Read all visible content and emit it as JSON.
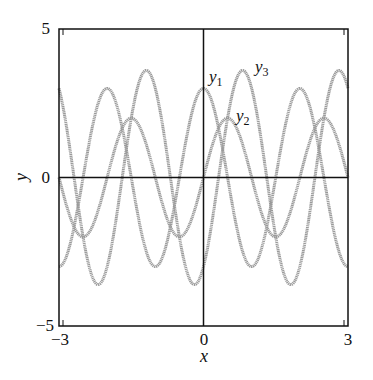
{
  "chart_data": {
    "type": "line",
    "title": "",
    "xlabel": "x",
    "ylabel": "y",
    "xlim": [
      -3,
      3
    ],
    "ylim": [
      -5,
      5
    ],
    "grid": false,
    "legend": "none (curves labeled inline)",
    "x_ticks": [
      -3,
      0,
      3
    ],
    "x_tick_labels": [
      "−3",
      "0",
      "3"
    ],
    "y_ticks": [
      -5,
      0,
      5
    ],
    "y_tick_labels": [
      "−5",
      "0",
      "5"
    ],
    "zero_axes": true,
    "line_color": "#9a9a9a",
    "axis_color": "#111111",
    "x": [
      -3,
      -2.5,
      -2,
      -1.5,
      -1,
      -0.5,
      0,
      0.5,
      1,
      1.5,
      2,
      2.5,
      3
    ],
    "series": [
      {
        "name": "y1",
        "label_main": "y",
        "label_sub": "1",
        "formula": "3cos(πx)",
        "amplitude": 3,
        "period": 2,
        "values": [
          -3,
          0,
          3,
          0,
          -3,
          0,
          3,
          0,
          -3,
          0,
          3,
          0,
          -3
        ],
        "label_pos": [
          210,
          83
        ]
      },
      {
        "name": "y2",
        "label_main": "y",
        "label_sub": "2",
        "formula": "2sin(πx)",
        "amplitude": 2,
        "period": 2,
        "values": [
          0,
          -2,
          0,
          2,
          0,
          -2,
          0,
          2,
          0,
          -2,
          0,
          2,
          0
        ],
        "label_pos": [
          237,
          122
        ]
      },
      {
        "name": "y3",
        "label_main": "y",
        "label_sub": "3",
        "formula": "2sin(πx) − 3cos(πx)",
        "amplitude": 3.6,
        "period": 2,
        "values": [
          3,
          -2,
          -3,
          2,
          3,
          -2,
          -3,
          2,
          3,
          -2,
          -3,
          2,
          3
        ],
        "label_pos": [
          256,
          73
        ]
      }
    ],
    "annotations": [
      "y1",
      "y2",
      "y3"
    ]
  }
}
